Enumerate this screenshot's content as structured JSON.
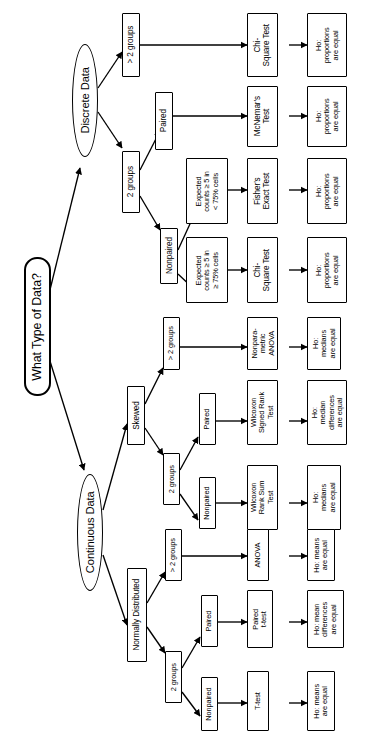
{
  "diagram": {
    "title": "What Type of Data?",
    "orientation": "rotated-90-ccw",
    "root": {
      "label": "What Type of Data?"
    },
    "branches": [
      {
        "label": "Discrete Data"
      },
      {
        "label": "Continuous Data"
      }
    ]
  },
  "nodes": {
    "root": "What Type of Data?",
    "discrete_data": "Discrete Data",
    "continuous_data": "Continuous Data",
    "d_gt2groups": "> 2 groups",
    "d_2groups": "2 groups",
    "d_paired": "Paired",
    "d_nonpaired": "Nonpaired",
    "d_expected_lt75": "Expected\ncounts ≥ 5 in\n< 75% cells",
    "d_expected_ge75": "Expected\ncounts ≥ 5 in\n≥ 75% cells",
    "test_chisq_top": "Chi-\nSquare Test",
    "test_mcnemar": "McNemar's\nTest",
    "test_fisher": "Fisher's\nExact Test",
    "test_chisq_bottom": "Chi-\nSquare Test",
    "out_prop1": "Ho:\nproportions\nare equal",
    "out_prop2": "Ho:\nproportions\nare equal",
    "out_prop3": "Ho:\nproportions\nare equal",
    "out_prop4": "Ho:\nproportions\nare equal",
    "skewed": "Skewed",
    "normally_distributed": "Normally Distributed",
    "s_gt2groups": "> 2 groups",
    "s_2groups": "2 groups",
    "s_paired": "Paired",
    "s_nonpaired": "Nonpaired",
    "test_np_anova": "Nonpara-\nmetric\nANOVA",
    "test_wilcoxon_signed": "Wilcoxon\nSigned Rank\nTest",
    "test_wilcoxon_rank_sum": "Wilcoxon\nRank Sum\nTest",
    "out_medians1": "Ho:\nmedians\nare equal",
    "out_median_diff": "Ho:\nmedian\ndifferences\nare equal",
    "out_medians2": "Ho:\nmedians\nare equal",
    "n_gt2groups": "> 2 groups",
    "n_2groups": "2 groups",
    "n_paired": "Paired",
    "n_nonpaired": "Nonpaired",
    "test_anova": "ANOVA",
    "test_paired_ttest": "Paired\nt-test",
    "test_ttest": "T-test",
    "out_means1": "Ho: means\nare equal",
    "out_mean_diff": "Ho: mean\ndifferences\nare equal",
    "out_means2": "Ho: means\nare equal"
  },
  "style": {
    "line_color": "#000000",
    "node_fill": "#ffffff",
    "node_stroke": "#000000",
    "background": "#ffffff"
  }
}
